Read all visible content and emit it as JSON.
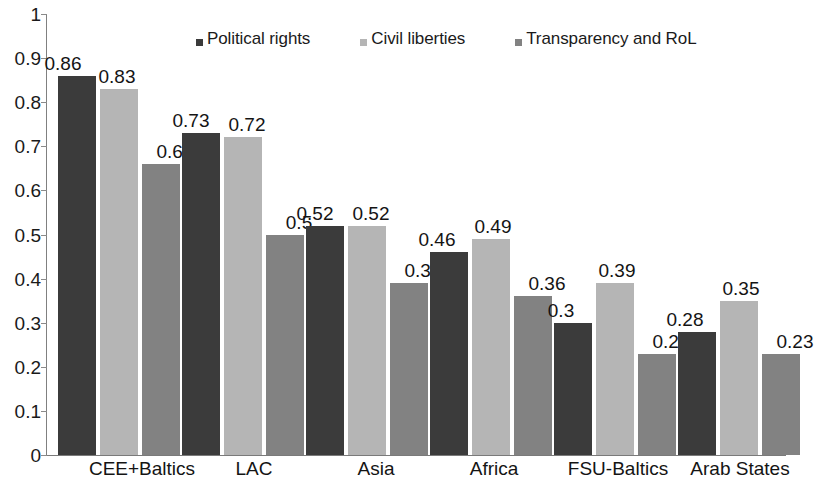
{
  "chart_data": {
    "type": "bar",
    "title": "",
    "xlabel": "",
    "ylabel": "",
    "ylim": [
      0,
      1
    ],
    "yticks": [
      "0",
      "0.1",
      "0.2",
      "0.3",
      "0.4",
      "0.5",
      "0.6",
      "0.7",
      "0.8",
      "0.9",
      "1"
    ],
    "grid": false,
    "legend_position": "top-center",
    "categories": [
      "CEE+Baltics",
      "LAC",
      "Asia",
      "Africa",
      "FSU-Baltics",
      "Arab States"
    ],
    "series": [
      {
        "name": "Political rights",
        "color": "#3b3b3b",
        "values": [
          0.86,
          0.73,
          0.52,
          0.46,
          0.3,
          0.28
        ],
        "labels": [
          "0.86",
          "0.73",
          "0.52",
          "0.46",
          "0.3",
          "0.28"
        ]
      },
      {
        "name": "Civil liberties",
        "color": "#b5b5b5",
        "values": [
          0.83,
          0.72,
          0.52,
          0.49,
          0.39,
          0.35
        ],
        "labels": [
          "0.83",
          "0.72",
          "0.52",
          "0.49",
          "0.39",
          "0.35"
        ]
      },
      {
        "name": "Transparency and RoL",
        "color": "#828282",
        "values": [
          0.66,
          0.5,
          0.39,
          0.36,
          0.23,
          0.23
        ],
        "labels": [
          "0.66",
          "0.5",
          "0.39",
          "0.36",
          "0.23",
          "0.23"
        ]
      }
    ]
  },
  "layout": {
    "group_starts": [
      12,
      136,
      260,
      384,
      508,
      632
    ],
    "group_width": 124,
    "bar_width": 38,
    "bar_gap": 4,
    "label_offsets": [
      [
        -14,
        -2,
        14
      ],
      [
        -10,
        4,
        14
      ],
      [
        -10,
        4,
        14
      ],
      [
        -12,
        2,
        14
      ],
      [
        -12,
        2,
        14
      ],
      [
        -12,
        2,
        14
      ]
    ],
    "x_label_centers": [
      96,
      208,
      330,
      448,
      572,
      694
    ]
  }
}
